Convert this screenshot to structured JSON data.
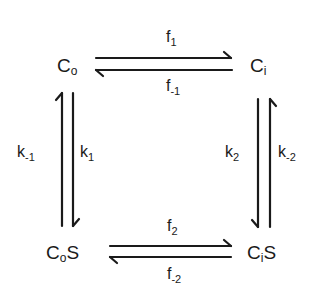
{
  "diagram": {
    "nodes": {
      "co": {
        "main": "C",
        "sub": "o"
      },
      "ci": {
        "main": "C",
        "sub": "i"
      },
      "cos": {
        "main": "C",
        "sub": "o",
        "suffix": "S"
      },
      "cis": {
        "main": "C",
        "sub": "i",
        "suffix": "S"
      }
    },
    "rates": {
      "f1": {
        "main": "f",
        "sub": "1"
      },
      "fm1": {
        "main": "f",
        "sub": "-1"
      },
      "f2": {
        "main": "f",
        "sub": "2"
      },
      "fm2": {
        "main": "f",
        "sub": "-2"
      },
      "k1": {
        "main": "k",
        "sub": "1"
      },
      "km1": {
        "main": "k",
        "sub": "-1"
      },
      "k2": {
        "main": "k",
        "sub": "2"
      },
      "km2": {
        "main": "k",
        "sub": "-2"
      }
    },
    "edges": [
      {
        "from": "Co",
        "to": "Ci",
        "forward": "f1",
        "reverse": "f-1"
      },
      {
        "from": "Co",
        "to": "CoS",
        "forward": "k1",
        "reverse": "k-1"
      },
      {
        "from": "Ci",
        "to": "CiS",
        "forward": "k2",
        "reverse": "k-2"
      },
      {
        "from": "CoS",
        "to": "CiS",
        "forward": "f2",
        "reverse": "f-2"
      }
    ],
    "stroke_color": "#1a1a1a"
  }
}
